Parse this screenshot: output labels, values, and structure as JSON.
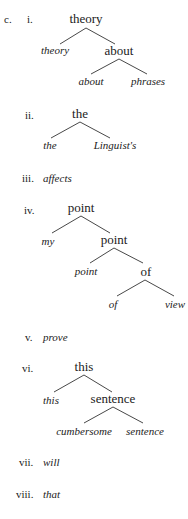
{
  "example_label": "c.",
  "items": [
    {
      "numeral": "i.",
      "root": "theory",
      "leaf_left": "theory",
      "node_right": "about",
      "leaf_about": "about",
      "leaf_phrases": "phrases"
    },
    {
      "numeral": "ii.",
      "root": "the",
      "leaf_left": "the",
      "leaf_right": "Linguist's"
    },
    {
      "numeral": "iii.",
      "word": "affects"
    },
    {
      "numeral": "iv.",
      "root": "point",
      "leaf_my": "my",
      "node_point": "point",
      "leaf_point": "point",
      "node_of": "of",
      "leaf_of": "of",
      "leaf_view": "view"
    },
    {
      "numeral": "v.",
      "word": "prove"
    },
    {
      "numeral": "vi.",
      "root": "this",
      "leaf_this": "this",
      "node_sentence": "sentence",
      "leaf_cumbersome": "cumbersome",
      "leaf_sentence": "sentence"
    },
    {
      "numeral": "vii.",
      "word": "will"
    },
    {
      "numeral": "viii.",
      "word": "that"
    }
  ]
}
